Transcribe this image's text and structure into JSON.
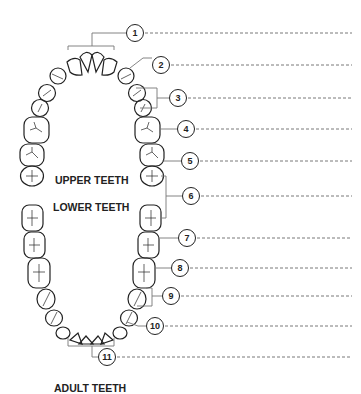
{
  "labels": {
    "upper": "UPPER TEETH",
    "lower": "LOWER TEETH",
    "title": "ADULT TEETH"
  },
  "callouts": [
    {
      "n": "1",
      "x": 135,
      "y": 33
    },
    {
      "n": "2",
      "x": 161,
      "y": 65
    },
    {
      "n": "3",
      "x": 178,
      "y": 98
    },
    {
      "n": "4",
      "x": 186,
      "y": 129
    },
    {
      "n": "5",
      "x": 190,
      "y": 161
    },
    {
      "n": "6",
      "x": 191,
      "y": 196
    },
    {
      "n": "7",
      "x": 187,
      "y": 238
    },
    {
      "n": "8",
      "x": 180,
      "y": 268
    },
    {
      "n": "9",
      "x": 171,
      "y": 296
    },
    {
      "n": "10",
      "x": 155,
      "y": 326
    },
    {
      "n": "11",
      "x": 107,
      "y": 357
    }
  ],
  "colors": {
    "stroke": "#222222",
    "leader": "#777777",
    "background": "#ffffff"
  }
}
